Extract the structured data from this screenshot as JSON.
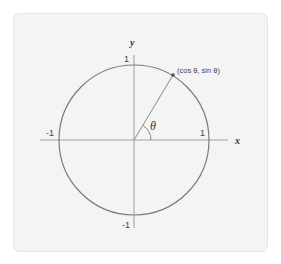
{
  "diagram": {
    "type": "unit-circle",
    "center": {
      "x": 134,
      "y": 140
    },
    "radius": 75,
    "angle_deg": 59,
    "colors": {
      "panel_bg": "#f4f4f4",
      "circle": "#7a7a7a",
      "axis": "#9a9a9a",
      "text": "#444444"
    },
    "axes": {
      "x_label": "x",
      "y_label": "y",
      "x_ticks": {
        "neg": "-1",
        "pos": "1"
      },
      "y_ticks": {
        "neg": "-1",
        "pos": "1"
      }
    },
    "angle_label": "θ",
    "point_label": "(cos  θ, sin  θ)"
  }
}
